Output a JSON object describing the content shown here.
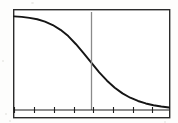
{
  "figure": {
    "background_color": "#fdfdfc",
    "frame": {
      "x": 13,
      "y": 9,
      "width": 157,
      "height": 109,
      "stroke_color": "#2b2b2b",
      "stroke_width": 1.4,
      "fill": "#ffffff"
    },
    "axis_baseline": {
      "y": 110,
      "x_start": 14,
      "x_end": 169,
      "stroke_color": "#1f1f1f",
      "stroke_width": 1.2
    }
  },
  "chart_data": {
    "type": "line",
    "title": "",
    "subtitle": "",
    "xlabel": "",
    "ylabel": "",
    "grid": false,
    "legend": null,
    "legend_position": "none",
    "xlim": [
      0,
      10
    ],
    "ylim": [
      0,
      1
    ],
    "x_tick_labels": [],
    "y_tick_labels": [],
    "x_tick_count": 8,
    "series": [
      {
        "name": "sigmoid-decay",
        "stroke_color": "#151515",
        "stroke_width": 1.9,
        "x": [
          0.0,
          0.5,
          1.0,
          1.5,
          2.0,
          2.5,
          3.0,
          3.5,
          4.0,
          4.5,
          5.0,
          5.5,
          6.0,
          6.5,
          7.0,
          7.5,
          8.0,
          8.5,
          9.0,
          9.5,
          10.0
        ],
        "values": [
          0.975,
          0.97,
          0.96,
          0.945,
          0.92,
          0.885,
          0.835,
          0.77,
          0.685,
          0.59,
          0.49,
          0.392,
          0.305,
          0.232,
          0.173,
          0.128,
          0.094,
          0.068,
          0.05,
          0.036,
          0.026
        ]
      }
    ],
    "annotations": [
      {
        "name": "inflection-marker",
        "type": "vertical-line",
        "x": 5.0,
        "y_top": 1.0,
        "y_bottom": 0.0,
        "stroke_color": "#8a8a8a",
        "stroke_width": 1.3,
        "label": ""
      }
    ]
  },
  "ticks": {
    "marks": [
      {
        "x": 14
      },
      {
        "x": 34
      },
      {
        "x": 54
      },
      {
        "x": 74
      },
      {
        "x": 93
      },
      {
        "x": 113
      },
      {
        "x": 133
      },
      {
        "x": 152
      }
    ],
    "length": 6,
    "stroke_color": "#1f1f1f",
    "stroke_width": 1.1
  },
  "artifacts": {
    "specks": [
      {
        "x": 31,
        "y": 2,
        "size": 3
      },
      {
        "x": 5,
        "y": 113,
        "size": 2
      },
      {
        "x": 9,
        "y": 120,
        "size": 2
      },
      {
        "x": 164,
        "y": 121,
        "size": 2
      },
      {
        "x": 2,
        "y": 60,
        "size": 2
      }
    ]
  }
}
